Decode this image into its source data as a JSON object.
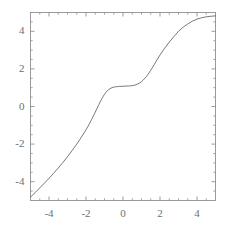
{
  "chart_data": {
    "type": "line",
    "title": "",
    "subtitle": "",
    "xlabel": "",
    "ylabel": "",
    "xlim": [
      -5,
      5
    ],
    "ylim": [
      -5,
      5
    ],
    "grid": false,
    "legend": null,
    "legend_position": "none",
    "xticks": [
      -4,
      -2,
      0,
      2,
      4
    ],
    "xtick_labels": [
      "-4",
      "-2",
      "0",
      "2",
      "4"
    ],
    "yticks": [
      -4,
      -2,
      0,
      2,
      4
    ],
    "ytick_labels": [
      "-4",
      "-2",
      "0",
      "2",
      "4"
    ],
    "minor_xticks": [
      -5,
      -4.5,
      -3.5,
      -3,
      -2.5,
      -1.5,
      -1,
      -0.5,
      0.5,
      1,
      1.5,
      2.5,
      3,
      3.5,
      4.5,
      5
    ],
    "minor_yticks": [
      -5,
      -4.5,
      -3.5,
      -3,
      -2.5,
      -1.5,
      -1,
      -0.5,
      0.5,
      1,
      1.5,
      2.5,
      3,
      3.5,
      4.5,
      5
    ],
    "line_color": "#555555",
    "line_width": 0.8,
    "frame_color": "#909090",
    "background_color": "#ffffff",
    "series": [
      {
        "name": "curve",
        "x": [
          -5.0,
          -4.75,
          -4.5,
          -4.25,
          -4.0,
          -3.75,
          -3.5,
          -3.25,
          -3.0,
          -2.75,
          -2.5,
          -2.25,
          -2.0,
          -1.9,
          -1.8,
          -1.7,
          -1.6,
          -1.5,
          -1.4,
          -1.3,
          -1.2,
          -1.1,
          -1.0,
          -0.9,
          -0.8,
          -0.7,
          -0.6,
          -0.5,
          -0.4,
          -0.3,
          -0.2,
          -0.1,
          0.0,
          0.1,
          0.2,
          0.3,
          0.4,
          0.5,
          0.6,
          0.7,
          0.8,
          0.9,
          1.0,
          1.1,
          1.2,
          1.3,
          1.4,
          1.5,
          1.6,
          1.7,
          1.8,
          1.9,
          2.0,
          2.25,
          2.5,
          2.75,
          3.0,
          3.25,
          3.5,
          3.75,
          4.0,
          4.25,
          4.5,
          4.75,
          5.0
        ],
        "y": [
          -4.82,
          -4.58,
          -4.33,
          -4.08,
          -3.82,
          -3.55,
          -3.27,
          -2.98,
          -2.67,
          -2.34,
          -2.0,
          -1.63,
          -1.24,
          -1.07,
          -0.89,
          -0.7,
          -0.5,
          -0.3,
          -0.09,
          0.11,
          0.31,
          0.49,
          0.65,
          0.78,
          0.88,
          0.95,
          1.0,
          1.03,
          1.05,
          1.06,
          1.07,
          1.07,
          1.08,
          1.08,
          1.09,
          1.09,
          1.1,
          1.11,
          1.13,
          1.16,
          1.2,
          1.25,
          1.32,
          1.41,
          1.52,
          1.64,
          1.78,
          1.93,
          2.09,
          2.25,
          2.42,
          2.58,
          2.74,
          3.1,
          3.42,
          3.72,
          4.0,
          4.22,
          4.39,
          4.54,
          4.65,
          4.72,
          4.77,
          4.8,
          4.82
        ]
      }
    ]
  }
}
